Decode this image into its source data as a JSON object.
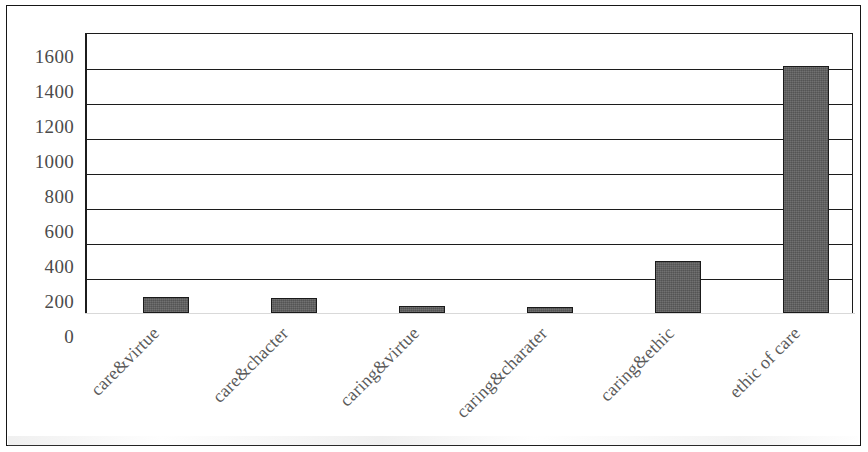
{
  "figure": {
    "background_color": "#ffffff",
    "frame_color": "#161616",
    "bar_color": "#5c5c5c",
    "bar_edge_color": "#1a1a1a",
    "gridline_color": "#1c1c1c",
    "axis_text_color": "#4b4b4b",
    "category_text_color": "#5a5a5a"
  },
  "chart_data": {
    "type": "bar",
    "title": "",
    "subtitle": "",
    "xlabel": "",
    "ylabel": "",
    "categories": [
      "care&virtue",
      "care&chacter",
      "caring&virtue",
      "caring&charater",
      "caring&ethic",
      "ethic of care"
    ],
    "values": [
      90,
      85,
      40,
      35,
      300,
      1410
    ],
    "ylim": [
      0,
      1600
    ],
    "ytick_labels": [
      "0",
      "200",
      "400",
      "600",
      "800",
      "1000",
      "1200",
      "1400",
      "1600"
    ],
    "ytick_values": [
      0,
      200,
      400,
      600,
      800,
      1000,
      1200,
      1400,
      1600
    ],
    "grid": true,
    "grid_axis": "y",
    "legend": false,
    "legend_position": "none",
    "category_label_rotation": -45,
    "series": [
      {
        "name": "",
        "values": [
          90,
          85,
          40,
          35,
          300,
          1410
        ]
      }
    ]
  }
}
